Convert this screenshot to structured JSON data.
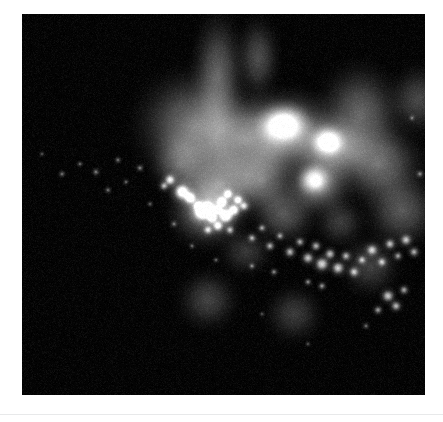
{
  "page": {
    "background_color": "#ffffff",
    "width": 443,
    "height": 422
  },
  "figure": {
    "name": "fluorescence-micrograph",
    "modality": "fluorescence microscopy",
    "background_color": "#000000",
    "panel": {
      "x": 22,
      "y": 14,
      "width": 403,
      "height": 381
    },
    "colormap": "grayscale",
    "channel_color": "#ffffff"
  },
  "divider": {
    "color": "#e8e9ea",
    "y": 414
  },
  "chart_data": {
    "type": "heatmap",
    "title": "",
    "xlabel": "",
    "ylabel": "",
    "xlim": [
      0,
      403
    ],
    "ylim": [
      0,
      381
    ],
    "grid": false,
    "legend": "none",
    "colormap": "gray",
    "value_range": [
      0,
      255
    ],
    "background_value": 4,
    "diffuse_clouds": [
      {
        "cx": 196,
        "cy": 60,
        "rx": 34,
        "ry": 52,
        "intensity": 96,
        "blur": 26
      },
      {
        "cx": 236,
        "cy": 44,
        "rx": 22,
        "ry": 30,
        "intensity": 74,
        "blur": 22
      },
      {
        "cx": 172,
        "cy": 112,
        "rx": 46,
        "ry": 44,
        "intensity": 118,
        "blur": 28
      },
      {
        "cx": 222,
        "cy": 126,
        "rx": 52,
        "ry": 40,
        "intensity": 126,
        "blur": 26
      },
      {
        "cx": 268,
        "cy": 118,
        "rx": 40,
        "ry": 34,
        "intensity": 150,
        "blur": 22
      },
      {
        "cx": 262,
        "cy": 110,
        "rx": 20,
        "ry": 16,
        "intensity": 196,
        "blur": 14
      },
      {
        "cx": 310,
        "cy": 134,
        "rx": 28,
        "ry": 26,
        "intensity": 150,
        "blur": 18
      },
      {
        "cx": 306,
        "cy": 128,
        "rx": 13,
        "ry": 12,
        "intensity": 186,
        "blur": 10
      },
      {
        "cx": 338,
        "cy": 102,
        "rx": 36,
        "ry": 40,
        "intensity": 104,
        "blur": 26
      },
      {
        "cx": 356,
        "cy": 150,
        "rx": 34,
        "ry": 30,
        "intensity": 112,
        "blur": 24
      },
      {
        "cx": 296,
        "cy": 170,
        "rx": 24,
        "ry": 22,
        "intensity": 138,
        "blur": 18
      },
      {
        "cx": 292,
        "cy": 166,
        "rx": 12,
        "ry": 11,
        "intensity": 170,
        "blur": 10
      },
      {
        "cx": 198,
        "cy": 170,
        "rx": 34,
        "ry": 30,
        "intensity": 122,
        "blur": 22
      },
      {
        "cx": 186,
        "cy": 196,
        "rx": 30,
        "ry": 28,
        "intensity": 132,
        "blur": 20
      },
      {
        "cx": 240,
        "cy": 166,
        "rx": 26,
        "ry": 24,
        "intensity": 110,
        "blur": 20
      },
      {
        "cx": 262,
        "cy": 200,
        "rx": 22,
        "ry": 20,
        "intensity": 86,
        "blur": 20
      },
      {
        "cx": 380,
        "cy": 196,
        "rx": 26,
        "ry": 26,
        "intensity": 86,
        "blur": 22
      },
      {
        "cx": 396,
        "cy": 86,
        "rx": 22,
        "ry": 24,
        "intensity": 70,
        "blur": 20
      },
      {
        "cx": 158,
        "cy": 150,
        "rx": 22,
        "ry": 24,
        "intensity": 84,
        "blur": 20
      },
      {
        "cx": 186,
        "cy": 286,
        "rx": 20,
        "ry": 20,
        "intensity": 64,
        "blur": 18
      },
      {
        "cx": 272,
        "cy": 300,
        "rx": 18,
        "ry": 18,
        "intensity": 56,
        "blur": 18
      },
      {
        "cx": 348,
        "cy": 252,
        "rx": 20,
        "ry": 20,
        "intensity": 62,
        "blur": 18
      },
      {
        "cx": 224,
        "cy": 238,
        "rx": 18,
        "ry": 16,
        "intensity": 52,
        "blur": 16
      },
      {
        "cx": 318,
        "cy": 208,
        "rx": 16,
        "ry": 16,
        "intensity": 58,
        "blur": 16
      }
    ],
    "bright_puncta": [
      {
        "cx": 160,
        "cy": 178,
        "r": 5.0,
        "intensity": 246
      },
      {
        "cx": 168,
        "cy": 184,
        "r": 4.0,
        "intensity": 230
      },
      {
        "cx": 176,
        "cy": 192,
        "r": 3.2,
        "intensity": 214
      },
      {
        "cx": 180,
        "cy": 198,
        "r": 5.4,
        "intensity": 252
      },
      {
        "cx": 186,
        "cy": 194,
        "r": 4.2,
        "intensity": 238
      },
      {
        "cx": 190,
        "cy": 204,
        "r": 3.6,
        "intensity": 222
      },
      {
        "cx": 196,
        "cy": 196,
        "r": 3.0,
        "intensity": 210
      },
      {
        "cx": 200,
        "cy": 188,
        "r": 3.4,
        "intensity": 224
      },
      {
        "cx": 206,
        "cy": 180,
        "r": 3.0,
        "intensity": 206
      },
      {
        "cx": 204,
        "cy": 202,
        "r": 4.6,
        "intensity": 244
      },
      {
        "cx": 212,
        "cy": 196,
        "r": 3.8,
        "intensity": 228
      },
      {
        "cx": 216,
        "cy": 186,
        "r": 3.2,
        "intensity": 214
      },
      {
        "cx": 222,
        "cy": 192,
        "r": 3.0,
        "intensity": 200
      },
      {
        "cx": 196,
        "cy": 212,
        "r": 3.4,
        "intensity": 218
      },
      {
        "cx": 186,
        "cy": 216,
        "r": 2.8,
        "intensity": 196
      },
      {
        "cx": 208,
        "cy": 216,
        "r": 2.6,
        "intensity": 190
      },
      {
        "cx": 148,
        "cy": 166,
        "r": 3.4,
        "intensity": 216
      },
      {
        "cx": 142,
        "cy": 172,
        "r": 2.6,
        "intensity": 188
      },
      {
        "cx": 230,
        "cy": 224,
        "r": 2.4,
        "intensity": 178
      },
      {
        "cx": 240,
        "cy": 214,
        "r": 2.2,
        "intensity": 172
      },
      {
        "cx": 248,
        "cy": 232,
        "r": 2.6,
        "intensity": 184
      },
      {
        "cx": 258,
        "cy": 222,
        "r": 2.2,
        "intensity": 168
      },
      {
        "cx": 268,
        "cy": 238,
        "r": 3.0,
        "intensity": 196
      },
      {
        "cx": 278,
        "cy": 228,
        "r": 2.6,
        "intensity": 180
      },
      {
        "cx": 286,
        "cy": 244,
        "r": 3.4,
        "intensity": 206
      },
      {
        "cx": 294,
        "cy": 232,
        "r": 2.8,
        "intensity": 190
      },
      {
        "cx": 300,
        "cy": 250,
        "r": 4.2,
        "intensity": 222
      },
      {
        "cx": 308,
        "cy": 240,
        "r": 3.2,
        "intensity": 200
      },
      {
        "cx": 316,
        "cy": 254,
        "r": 3.8,
        "intensity": 214
      },
      {
        "cx": 324,
        "cy": 242,
        "r": 2.8,
        "intensity": 188
      },
      {
        "cx": 332,
        "cy": 258,
        "r": 3.0,
        "intensity": 196
      },
      {
        "cx": 340,
        "cy": 246,
        "r": 2.6,
        "intensity": 182
      },
      {
        "cx": 350,
        "cy": 236,
        "r": 3.4,
        "intensity": 204
      },
      {
        "cx": 360,
        "cy": 248,
        "r": 2.8,
        "intensity": 190
      },
      {
        "cx": 368,
        "cy": 230,
        "r": 3.0,
        "intensity": 196
      },
      {
        "cx": 376,
        "cy": 242,
        "r": 2.4,
        "intensity": 176
      },
      {
        "cx": 384,
        "cy": 226,
        "r": 3.2,
        "intensity": 200
      },
      {
        "cx": 392,
        "cy": 238,
        "r": 2.8,
        "intensity": 186
      },
      {
        "cx": 366,
        "cy": 282,
        "r": 3.6,
        "intensity": 208
      },
      {
        "cx": 374,
        "cy": 292,
        "r": 3.0,
        "intensity": 194
      },
      {
        "cx": 382,
        "cy": 276,
        "r": 2.6,
        "intensity": 180
      },
      {
        "cx": 356,
        "cy": 296,
        "r": 2.4,
        "intensity": 174
      },
      {
        "cx": 300,
        "cy": 272,
        "r": 2.2,
        "intensity": 166
      },
      {
        "cx": 286,
        "cy": 268,
        "r": 2.0,
        "intensity": 160
      },
      {
        "cx": 252,
        "cy": 258,
        "r": 2.0,
        "intensity": 156
      },
      {
        "cx": 230,
        "cy": 252,
        "r": 1.8,
        "intensity": 148
      },
      {
        "cx": 118,
        "cy": 154,
        "r": 2.0,
        "intensity": 150
      },
      {
        "cx": 96,
        "cy": 146,
        "r": 1.8,
        "intensity": 140
      },
      {
        "cx": 74,
        "cy": 158,
        "r": 2.0,
        "intensity": 146
      },
      {
        "cx": 58,
        "cy": 150,
        "r": 1.6,
        "intensity": 132
      },
      {
        "cx": 40,
        "cy": 160,
        "r": 1.8,
        "intensity": 138
      },
      {
        "cx": 104,
        "cy": 168,
        "r": 1.6,
        "intensity": 130
      },
      {
        "cx": 86,
        "cy": 176,
        "r": 1.8,
        "intensity": 136
      },
      {
        "cx": 128,
        "cy": 190,
        "r": 1.6,
        "intensity": 128
      },
      {
        "cx": 20,
        "cy": 140,
        "r": 1.4,
        "intensity": 120
      },
      {
        "cx": 152,
        "cy": 210,
        "r": 1.8,
        "intensity": 140
      },
      {
        "cx": 170,
        "cy": 232,
        "r": 1.6,
        "intensity": 132
      },
      {
        "cx": 194,
        "cy": 246,
        "r": 1.6,
        "intensity": 128
      },
      {
        "cx": 398,
        "cy": 160,
        "r": 2.0,
        "intensity": 150
      },
      {
        "cx": 390,
        "cy": 104,
        "r": 1.6,
        "intensity": 130
      },
      {
        "cx": 344,
        "cy": 312,
        "r": 1.8,
        "intensity": 136
      },
      {
        "cx": 286,
        "cy": 330,
        "r": 1.4,
        "intensity": 118
      },
      {
        "cx": 240,
        "cy": 300,
        "r": 1.4,
        "intensity": 116
      }
    ],
    "noise": {
      "type": "speckle",
      "amplitude": 10,
      "density": 0.55
    }
  }
}
